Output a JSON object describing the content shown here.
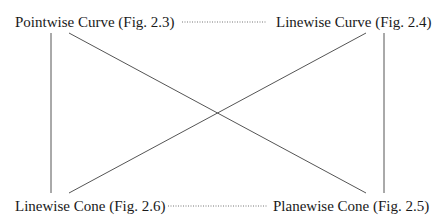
{
  "diagram": {
    "nodes": [
      {
        "id": "pointwise_curve",
        "label": "Pointwise Curve (Fig. 2.3)"
      },
      {
        "id": "linewise_curve",
        "label": "Linewise Curve (Fig. 2.4)"
      },
      {
        "id": "linewise_cone",
        "label": "Linewise Cone (Fig. 2.6)"
      },
      {
        "id": "planewise_cone",
        "label": "Planewise Cone (Fig. 2.5)"
      }
    ],
    "edges": [
      {
        "from": "pointwise_curve",
        "to": "linewise_curve",
        "style": "dotted"
      },
      {
        "from": "linewise_cone",
        "to": "planewise_cone",
        "style": "dotted"
      },
      {
        "from": "pointwise_curve",
        "to": "linewise_cone",
        "style": "solid"
      },
      {
        "from": "linewise_curve",
        "to": "planewise_cone",
        "style": "solid"
      },
      {
        "from": "pointwise_curve",
        "to": "planewise_cone",
        "style": "solid"
      },
      {
        "from": "linewise_curve",
        "to": "linewise_cone",
        "style": "solid"
      }
    ],
    "colors": {
      "line": "#555555",
      "text": "#1a1a1a"
    }
  }
}
